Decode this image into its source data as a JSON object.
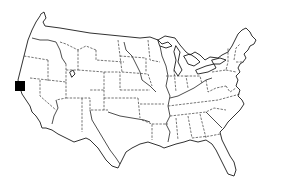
{
  "map": {
    "region": "Contiguous United States",
    "style": "black-and-white outline with dashed state borders",
    "background_color": "#ffffff",
    "line_color": "#1a1a1a"
  },
  "marker": {
    "shape": "square",
    "color": "#000000",
    "location_description": "Northern California coast",
    "x": 15,
    "y": 81,
    "width": 10,
    "height": 10
  }
}
